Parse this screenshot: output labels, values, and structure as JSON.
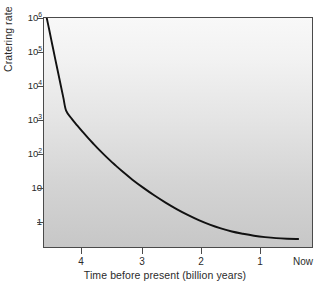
{
  "chart_data": {
    "type": "line",
    "title": "",
    "xlabel": "Time before present (billion years)",
    "ylabel": "Cratering rate",
    "x_tick_labels": [
      "4",
      "3",
      "2",
      "1",
      "Now"
    ],
    "x_tick_values": [
      4,
      3,
      2,
      1,
      0
    ],
    "xlim": [
      4.6,
      -0.25
    ],
    "x_axis_reversed": true,
    "y_scale": "log",
    "ylim": [
      0.32,
      1000000
    ],
    "y_tick_labels": [
      "10⁶",
      "10⁵",
      "10⁴",
      "10³",
      "10²",
      "10",
      "1"
    ],
    "y_tick_values": [
      1000000,
      100000,
      10000,
      1000,
      100,
      10,
      1
    ],
    "y_tick_mantissas": [
      "10",
      "10",
      "10",
      "10",
      "10",
      "10",
      "1"
    ],
    "y_tick_exponents": [
      "6",
      "5",
      "4",
      "3",
      "2",
      "",
      ""
    ],
    "grid": false,
    "legend": "none",
    "series": [
      {
        "name": "Cratering rate",
        "x": [
          4.55,
          4.5,
          4.45,
          4.4,
          4.35,
          4.3,
          4.25,
          4.2,
          4.1,
          4.0,
          3.9,
          3.8,
          3.7,
          3.6,
          3.5,
          3.4,
          3.3,
          3.2,
          3.0,
          2.8,
          2.6,
          2.4,
          2.2,
          2.0,
          1.8,
          1.6,
          1.4,
          1.2,
          1.0,
          0.8,
          0.6,
          0.4,
          0.2,
          0.0
        ],
        "y": [
          1000000,
          420000,
          175000,
          73000,
          31000,
          13000,
          5500,
          2350,
          1400,
          900,
          590,
          390,
          265,
          182,
          127,
          90,
          65,
          47,
          26,
          15.2,
          9.2,
          5.8,
          3.8,
          2.6,
          1.85,
          1.38,
          1.08,
          0.88,
          0.76,
          0.67,
          0.61,
          0.57,
          0.55,
          0.54
        ]
      }
    ],
    "annotations": [],
    "curve_description": "Exponential decline of impact cratering rate from about 10⁶ at 4.55 billion years before present, falling steeply through the early heavy bombardment and leveling off to a near-constant value below 1 over the last billion years.",
    "colors": {
      "curve": "#111111",
      "axis": "#4a4a4a",
      "plot_background_top": "#f8f8f8",
      "plot_background_bottom": "#c7c7c7",
      "page_background": "#ffffff",
      "text": "#2b2b2b"
    }
  },
  "geometry": {
    "plot_left": 43,
    "plot_top": 17,
    "plot_width": 270,
    "plot_height": 231,
    "y_tick_pixels": [
      18,
      52,
      86,
      120,
      154,
      188,
      222
    ],
    "x_tick_pixels": [
      81,
      142,
      201,
      260
    ],
    "x_label_pixels": [
      81,
      142,
      201,
      260,
      303
    ]
  }
}
